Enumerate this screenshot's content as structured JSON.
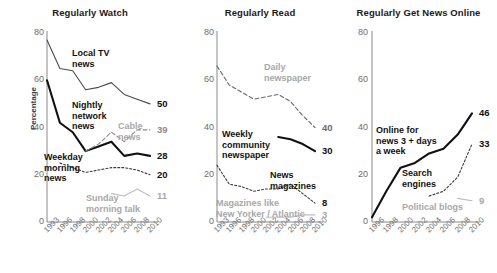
{
  "figure": {
    "ylabel": "Percentage",
    "yticks": [
      "80",
      "60",
      "40",
      "20",
      "0"
    ],
    "ytick_values": [
      80,
      60,
      40,
      20,
      0
    ],
    "ylim": [
      0,
      80
    ]
  },
  "panels": [
    {
      "title": "Regularly Watch",
      "x": [
        "1993",
        "1996",
        "1998",
        "2000",
        "2002",
        "2004",
        "2006",
        "2008",
        "2010"
      ],
      "series": [
        {
          "name": "Local TV news",
          "label": "Local TV\nnews",
          "style": "thin-solid",
          "color": "#4a4a4a",
          "values": [
            77,
            65,
            64,
            56,
            57,
            59,
            54,
            52,
            50
          ],
          "end_value": "50",
          "end_color": "#111111"
        },
        {
          "name": "Nightly network news",
          "label": "Nightly\nnetwork\nnews",
          "style": "thick-solid",
          "color": "#111111",
          "values": [
            60,
            42,
            38,
            30,
            32,
            34,
            28,
            29,
            28
          ],
          "end_value": "28",
          "end_color": "#111111"
        },
        {
          "name": "Cable news",
          "label": "Cable\nnews",
          "style": "thin-dashed",
          "color": "#8c8c8c",
          "values": [
            null,
            null,
            null,
            30,
            33,
            38,
            34,
            39,
            39
          ],
          "end_value": "39",
          "end_color": "#8c8c8c"
        },
        {
          "name": "Weekday morning news",
          "label": "Weekday\nmorning\nnews",
          "style": "thin-dotted",
          "color": "#3b3b3b",
          "values": [
            null,
            25,
            23,
            21,
            22,
            23,
            23,
            22,
            20
          ],
          "end_value": "20",
          "end_color": "#111111"
        },
        {
          "name": "Sunday morning talk",
          "label": "Sunday\nmorning talk",
          "style": "thin-solid",
          "color": "#bdbdbd",
          "values": [
            null,
            null,
            null,
            null,
            null,
            12,
            11,
            14,
            11
          ],
          "end_value": "11",
          "end_color": "#bdbdbd"
        }
      ]
    },
    {
      "title": "Regularly Read",
      "x": [
        "1993",
        "1996",
        "1998",
        "2000",
        "2002",
        "2004",
        "2006",
        "2008",
        "2010"
      ],
      "series": [
        {
          "name": "Daily newspaper",
          "label": "Daily\nnewspaper",
          "style": "thin-dashed",
          "color": "#6b6b6b",
          "values": [
            66,
            58,
            55,
            52,
            53,
            54,
            51,
            45,
            40
          ],
          "end_value": "40",
          "end_color": "#6b6b6b"
        },
        {
          "name": "Weekly community newspaper",
          "label": "Weekly\ncommunity\nnewspaper",
          "style": "thick-solid",
          "color": "#111111",
          "values": [
            null,
            null,
            null,
            null,
            null,
            36,
            35,
            33,
            30
          ],
          "end_value": "30",
          "end_color": "#111111"
        },
        {
          "name": "News magazines",
          "label": "News\nmagazines",
          "style": "thin-dotted",
          "color": "#3b3b3b",
          "values": [
            24,
            16,
            15,
            13,
            14,
            14,
            16,
            12,
            8
          ],
          "end_value": "8",
          "end_color": "#111111"
        },
        {
          "name": "Magazines like New Yorker / Atlantic",
          "label": "Magazines like\nNew Yorker / Atlantic",
          "style": "thin-solid",
          "color": "#bdbdbd",
          "values": [
            null,
            null,
            null,
            null,
            2,
            2,
            2,
            3,
            3
          ],
          "end_value": "3",
          "end_color": "#bdbdbd"
        }
      ]
    },
    {
      "title": "Regularly Get News Online",
      "x": [
        "1996",
        "1998",
        "2000",
        "2002",
        "2004",
        "2006",
        "2008",
        "2010"
      ],
      "series": [
        {
          "name": "Online for news 3+ days a week",
          "label": "Online for\nnews 3 + days\na week",
          "style": "thick-solid",
          "color": "#111111",
          "values": [
            2,
            13,
            23,
            25,
            29,
            31,
            37,
            46
          ],
          "end_value": "46",
          "end_color": "#111111"
        },
        {
          "name": "Search engines",
          "label": "Search\nengines",
          "style": "thin-dotted",
          "color": "#3b3b3b",
          "values": [
            null,
            null,
            null,
            null,
            11,
            13,
            19,
            33
          ],
          "end_value": "33",
          "end_color": "#111111"
        },
        {
          "name": "Political blogs",
          "label": "Political blogs",
          "style": "thin-solid",
          "color": "#bdbdbd",
          "values": [
            null,
            null,
            null,
            null,
            null,
            null,
            10,
            9
          ],
          "end_value": "9",
          "end_color": "#bdbdbd"
        }
      ]
    }
  ],
  "chart_data": {
    "type": "line",
    "ylabel": "Percentage",
    "xlabel": "",
    "ylim": [
      0,
      80
    ],
    "grid": false,
    "legend": "inline-annotations",
    "panels": [
      {
        "title": "Regularly Watch",
        "x": [
          1993,
          1996,
          1998,
          2000,
          2002,
          2004,
          2006,
          2008,
          2010
        ],
        "series": [
          {
            "name": "Local TV news",
            "values": [
              77,
              65,
              64,
              56,
              57,
              59,
              54,
              52,
              50
            ],
            "end_label": 50
          },
          {
            "name": "Nightly network news",
            "values": [
              60,
              42,
              38,
              30,
              32,
              34,
              28,
              29,
              28
            ],
            "end_label": 28
          },
          {
            "name": "Cable news",
            "values": [
              null,
              null,
              null,
              30,
              33,
              38,
              34,
              39,
              39
            ],
            "end_label": 39
          },
          {
            "name": "Weekday morning news",
            "values": [
              null,
              25,
              23,
              21,
              22,
              23,
              23,
              22,
              20
            ],
            "end_label": 20
          },
          {
            "name": "Sunday morning talk",
            "values": [
              null,
              null,
              null,
              null,
              null,
              12,
              11,
              14,
              11
            ],
            "end_label": 11
          }
        ]
      },
      {
        "title": "Regularly Read",
        "x": [
          1993,
          1996,
          1998,
          2000,
          2002,
          2004,
          2006,
          2008,
          2010
        ],
        "series": [
          {
            "name": "Daily newspaper",
            "values": [
              66,
              58,
              55,
              52,
              53,
              54,
              51,
              45,
              40
            ],
            "end_label": 40
          },
          {
            "name": "Weekly community newspaper",
            "values": [
              null,
              null,
              null,
              null,
              null,
              36,
              35,
              33,
              30
            ],
            "end_label": 30
          },
          {
            "name": "News magazines",
            "values": [
              24,
              16,
              15,
              13,
              14,
              14,
              16,
              12,
              8
            ],
            "end_label": 8
          },
          {
            "name": "Magazines like New Yorker / Atlantic",
            "values": [
              null,
              null,
              null,
              null,
              2,
              2,
              2,
              3,
              3
            ],
            "end_label": 3
          }
        ]
      },
      {
        "title": "Regularly Get News Online",
        "x": [
          1996,
          1998,
          2000,
          2002,
          2004,
          2006,
          2008,
          2010
        ],
        "series": [
          {
            "name": "Online for news 3 + days a week",
            "values": [
              2,
              13,
              23,
              25,
              29,
              31,
              37,
              46
            ],
            "end_label": 46
          },
          {
            "name": "Search engines",
            "values": [
              null,
              null,
              null,
              null,
              11,
              13,
              19,
              33
            ],
            "end_label": 33
          },
          {
            "name": "Political blogs",
            "values": [
              null,
              null,
              null,
              null,
              null,
              null,
              10,
              9
            ],
            "end_label": 9
          }
        ]
      }
    ]
  },
  "annotations": {
    "p0": [
      {
        "key": "local-tv-news",
        "text": "Local TV\nnews",
        "left": 72,
        "top": 48,
        "gray": false
      },
      {
        "key": "nightly-network-news",
        "text": "Nightly\nnetwork\nnews",
        "left": 72,
        "top": 100,
        "gray": false
      },
      {
        "key": "cable-news",
        "text": "Cable\nnews",
        "left": 118,
        "top": 121,
        "gray": true
      },
      {
        "key": "weekday-morning-news",
        "text": "Weekday\nmorning\nnews",
        "left": 44,
        "top": 152,
        "gray": false
      },
      {
        "key": "sunday-morning-talk",
        "text": "Sunday\nmorning talk",
        "left": 86,
        "top": 193,
        "gray": true
      }
    ],
    "p1": [
      {
        "key": "daily-newspaper",
        "text": "Daily\nnewspaper",
        "left": 84,
        "top": 62,
        "gray": true
      },
      {
        "key": "weekly-community-newspaper",
        "text": "Weekly\ncommunity\nnewspaper",
        "left": 42,
        "top": 129,
        "gray": false
      },
      {
        "key": "news-magazines",
        "text": "News\nmagazines",
        "left": 90,
        "top": 170,
        "gray": false
      },
      {
        "key": "magazines-like-new-yorker",
        "text": "Magazines like\nNew Yorker / Atlantic",
        "left": 36,
        "top": 198,
        "gray": true
      }
    ],
    "p2": [
      {
        "key": "online-for-news",
        "text": "Online for\nnews 3 + days\na week",
        "left": 36,
        "top": 125,
        "gray": false
      },
      {
        "key": "search-engines",
        "text": "Search\nengines",
        "left": 62,
        "top": 168,
        "gray": false
      },
      {
        "key": "political-blogs",
        "text": "Political blogs",
        "left": 62,
        "top": 202,
        "gray": true
      }
    ]
  }
}
